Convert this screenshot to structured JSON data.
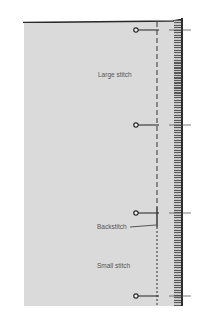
{
  "figure": {
    "type": "sewing-stitch-illustration"
  },
  "labels": {
    "large_stitch": "Large stitch",
    "backstitch": "Backstitch",
    "small_stitch": "Small stitch"
  },
  "pins": [
    {
      "id": "pin-1",
      "y": 30
    },
    {
      "id": "pin-2",
      "y": 125
    },
    {
      "id": "pin-3",
      "y": 213
    },
    {
      "id": "pin-4",
      "y": 296
    }
  ],
  "colors": {
    "background": "#ffffff",
    "fabric": "#dadada",
    "stitch": "#333333",
    "serge_dark": "#5a5a5a",
    "pin": "#222222",
    "label": "#555555"
  }
}
